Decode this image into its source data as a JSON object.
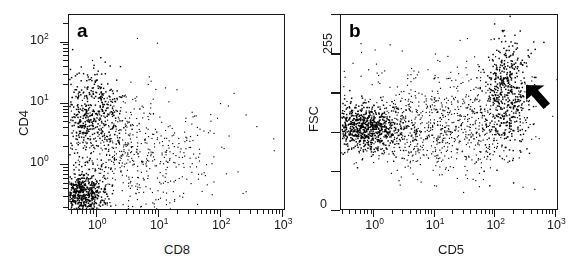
{
  "figure": {
    "background": "#ffffff",
    "ink": "#1a1a1a",
    "type": "two-panel-flow-cytometry-dotplot"
  },
  "panels": [
    {
      "id": "a",
      "letter": "a",
      "x_axis": {
        "label": "CD8",
        "scale": "log",
        "decades": [
          "0",
          "1",
          "2",
          "3"
        ],
        "tick_labels": [
          "10",
          "10",
          "10",
          "10"
        ],
        "tick_exponents": [
          "0",
          "1",
          "2",
          "3"
        ]
      },
      "y_axis": {
        "label": "CD4",
        "scale": "log",
        "decades": [
          "0",
          "1",
          "2"
        ],
        "tick_labels": [
          "10",
          "10",
          "10"
        ],
        "tick_exponents": [
          "0",
          "1",
          "2"
        ]
      }
    },
    {
      "id": "b",
      "letter": "b",
      "x_axis": {
        "label": "CD5",
        "scale": "log",
        "decades": [
          "0",
          "1",
          "2",
          "3"
        ],
        "tick_labels": [
          "10",
          "10",
          "10",
          "10"
        ],
        "tick_exponents": [
          "0",
          "1",
          "2",
          "3"
        ]
      },
      "y_axis": {
        "label": "FSC",
        "scale": "linear",
        "tick_labels": [
          "255",
          "0"
        ],
        "range_min": "0",
        "range_max": "255"
      },
      "annotation": {
        "type": "arrow",
        "name": "population-arrow",
        "points_to": "up-left",
        "target": "CD5-high FSC-high cluster"
      }
    }
  ],
  "chart_data": {
    "type": "scatter",
    "title": "",
    "panel_count": 2,
    "charts": [
      {
        "panel": "a",
        "type": "scatter",
        "title": "a",
        "xlabel": "CD8",
        "ylabel": "CD4",
        "xscale": "log",
        "yscale": "log",
        "xlim": [
          -0.45,
          3.05
        ],
        "ylim": [
          -0.75,
          2.45
        ],
        "x_ticks": [
          0,
          1,
          2,
          3
        ],
        "x_tick_labels": [
          "10^0",
          "10^1",
          "10^2",
          "10^3"
        ],
        "y_ticks": [
          0,
          1,
          2
        ],
        "y_tick_labels": [
          "10^0",
          "10^1",
          "10^2"
        ],
        "grid": false,
        "legend": false,
        "marker": "dot",
        "marker_size_px": 1.5,
        "marker_color": "#000000",
        "total_points": 1650,
        "populations": [
          {
            "name": "CD4-neg CD8-neg double negative",
            "cx": -0.24,
            "cy": -0.5,
            "sx": 0.19,
            "sy": 0.17,
            "n": 540,
            "density": "very-high"
          },
          {
            "name": "CD4-positive CD8-negative",
            "cx": -0.12,
            "cy": 0.82,
            "sx": 0.26,
            "sy": 0.36,
            "n": 430,
            "density": "high"
          },
          {
            "name": "CD4-intermediate spread",
            "cx": 0.28,
            "cy": 0.45,
            "sx": 0.42,
            "sy": 0.45,
            "n": 300,
            "density": "medium"
          },
          {
            "name": "CD8-positive scatter tail",
            "cx": 0.95,
            "cy": 0.1,
            "sx": 0.55,
            "sy": 0.5,
            "n": 230,
            "density": "low"
          },
          {
            "name": "sparse background",
            "cx": 0.75,
            "cy": -0.05,
            "sx": 0.95,
            "sy": 0.75,
            "n": 150,
            "density": "very-low"
          }
        ]
      },
      {
        "panel": "b",
        "type": "scatter",
        "title": "b",
        "xlabel": "CD5",
        "ylabel": "FSC",
        "xscale": "log",
        "yscale": "linear",
        "xlim": [
          -0.55,
          3.05
        ],
        "ylim": [
          0,
          255
        ],
        "x_ticks": [
          0,
          1,
          2,
          3
        ],
        "x_tick_labels": [
          "10^0",
          "10^1",
          "10^2",
          "10^3"
        ],
        "y_ticks": [
          0,
          255
        ],
        "y_tick_labels": [
          "0",
          "255"
        ],
        "grid": false,
        "legend": false,
        "marker": "dot",
        "marker_size_px": 1.5,
        "marker_color": "#000000",
        "total_points": 2200,
        "populations": [
          {
            "name": "CD5-low FSC-mid dense band",
            "cx": -0.18,
            "cy": 108,
            "sx": 0.34,
            "sy": 16,
            "n": 760,
            "density": "very-high"
          },
          {
            "name": "CD5-intermediate continuum",
            "cx": 0.72,
            "cy": 104,
            "sx": 0.52,
            "sy": 26,
            "n": 420,
            "density": "medium"
          },
          {
            "name": "CD5-high FSC-high cluster (arrow)",
            "cx": 2.18,
            "cy": 150,
            "sx": 0.2,
            "sy": 38,
            "n": 480,
            "density": "high"
          },
          {
            "name": "ascending bridge population",
            "cx": 1.62,
            "cy": 122,
            "sx": 0.4,
            "sy": 32,
            "n": 280,
            "density": "low"
          },
          {
            "name": "diffuse background",
            "cx": 1.0,
            "cy": 120,
            "sx": 1.05,
            "sy": 48,
            "n": 260,
            "density": "very-low"
          }
        ]
      }
    ]
  }
}
